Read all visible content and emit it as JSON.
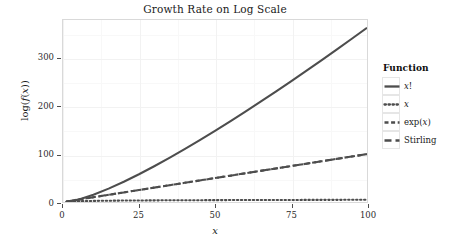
{
  "chart_data": {
    "type": "line",
    "title": "Growth Rate on Log Scale",
    "xlabel": "x",
    "ylabel": "log(f(x))",
    "xlim": [
      0,
      100
    ],
    "ylim": [
      0,
      380
    ],
    "xticks": [
      "0",
      "25",
      "50",
      "75",
      "100"
    ],
    "xtick_values": [
      0,
      25,
      50,
      75,
      100
    ],
    "yticks": [
      "0",
      "100",
      "200",
      "300"
    ],
    "ytick_values": [
      0,
      100,
      200,
      300
    ],
    "grid": true,
    "legend_position": "right",
    "legend_title": "Function",
    "x": [
      1,
      5,
      10,
      15,
      20,
      25,
      30,
      35,
      40,
      45,
      50,
      55,
      60,
      65,
      70,
      75,
      80,
      85,
      90,
      95,
      100
    ],
    "series": [
      {
        "name": "x!",
        "style": "solid",
        "color": "#4d4d4d",
        "values": [
          0,
          4.79,
          15.1,
          27.9,
          42.34,
          58.0,
          74.66,
          92.14,
          110.32,
          129.1,
          148.48,
          168.29,
          188.63,
          209.34,
          230.44,
          251.86,
          273.67,
          295.69,
          318.15,
          340.81,
          363.74
        ]
      },
      {
        "name": "x",
        "style": "dotted",
        "color": "#4d4d4d",
        "values": [
          0,
          1.61,
          2.3,
          2.71,
          3.0,
          3.22,
          3.4,
          3.56,
          3.69,
          3.81,
          3.91,
          4.01,
          4.09,
          4.17,
          4.25,
          4.32,
          4.38,
          4.44,
          4.5,
          4.55,
          4.61
        ]
      },
      {
        "name": "exp(x)",
        "style": "dash-short",
        "color": "#4d4d4d",
        "values": [
          1,
          5,
          10,
          15,
          20,
          25,
          30,
          35,
          40,
          45,
          50,
          55,
          60,
          65,
          70,
          75,
          80,
          85,
          90,
          95,
          100
        ]
      },
      {
        "name": "Stirling",
        "style": "dash-long",
        "color": "#4d4d4d",
        "values": [
          1,
          5,
          10,
          15,
          20,
          25,
          30,
          35,
          40,
          45,
          50,
          55,
          60,
          65,
          70,
          75,
          80,
          85,
          90,
          95,
          100
        ]
      }
    ],
    "legend_entries": [
      {
        "label": "x!",
        "style": "solid"
      },
      {
        "label": "x",
        "style": "dotted"
      },
      {
        "label": "exp(x)",
        "style": "dash-short"
      },
      {
        "label": "Stirling",
        "style": "dash-long"
      }
    ]
  }
}
